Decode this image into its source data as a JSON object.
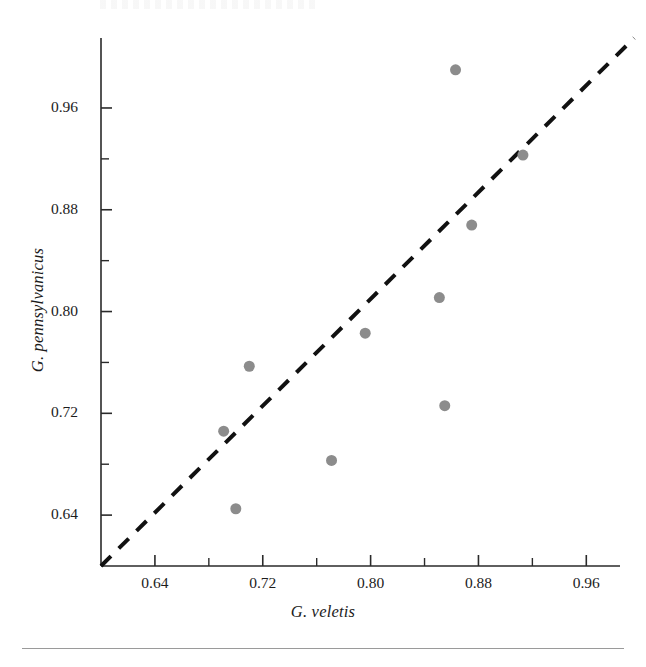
{
  "chart_data": {
    "type": "scatter",
    "title": "",
    "xlabel": "G. veletis",
    "ylabel": "G. pennsylvanicus",
    "xlim": [
      0.6,
      0.985
    ],
    "ylim": [
      0.6,
      1.015
    ],
    "xticks": [
      "0.64",
      "0.72",
      "0.80",
      "0.88",
      "0.96"
    ],
    "xtick_values": [
      0.64,
      0.72,
      0.8,
      0.88,
      0.96
    ],
    "yticks": [
      "0.64",
      "0.72",
      "0.80",
      "0.88",
      "0.96"
    ],
    "ytick_values": [
      0.64,
      0.72,
      0.8,
      0.88,
      0.96
    ],
    "minor_ticks": true,
    "minor_tick_step": 0.04,
    "grid": false,
    "legend": "none",
    "series": [
      {
        "name": "populations",
        "marker": "filled-circle",
        "color": "#8c8c8c",
        "marker_size": 11,
        "points": [
          {
            "x": 0.691,
            "y": 0.706
          },
          {
            "x": 0.71,
            "y": 0.757
          },
          {
            "x": 0.7,
            "y": 0.645
          },
          {
            "x": 0.771,
            "y": 0.683
          },
          {
            "x": 0.796,
            "y": 0.783
          },
          {
            "x": 0.851,
            "y": 0.811
          },
          {
            "x": 0.855,
            "y": 0.726
          },
          {
            "x": 0.863,
            "y": 0.99
          },
          {
            "x": 0.875,
            "y": 0.868
          },
          {
            "x": 0.913,
            "y": 0.923
          }
        ]
      }
    ],
    "reference_line": {
      "name": "one-to-one-line",
      "style": "dashed",
      "color": "#111111",
      "width": 4,
      "dash": "14,11",
      "from": {
        "x": 0.6,
        "y": 0.6
      },
      "to": {
        "x": 0.9955,
        "y": 1.015
      }
    },
    "annotations": []
  },
  "axes": {
    "x_title": "G. veletis",
    "y_title": "G. pennsylvanicus"
  }
}
